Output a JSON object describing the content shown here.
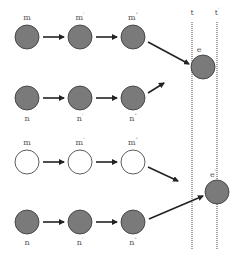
{
  "diagram": {
    "type": "state-transition",
    "colors": {
      "filled": "#7a7a7a",
      "stroke": "#333333",
      "empty": "#ffffff",
      "arrow": "#222222",
      "dotted_line": "#666666",
      "label": "#555555"
    },
    "timelines": [
      {
        "label": "t",
        "prime": "",
        "x": 192
      },
      {
        "label": "t",
        "prime": "′",
        "x": 217
      }
    ],
    "rows": [
      {
        "id": "row1",
        "y": 37,
        "filled": true,
        "label_position": "above",
        "nodes": [
          {
            "label": "m",
            "prime": "",
            "x": 27
          },
          {
            "label": "m",
            "prime": "′",
            "x": 80
          },
          {
            "label": "m",
            "prime": "″",
            "x": 133
          }
        ]
      },
      {
        "id": "row2",
        "y": 98,
        "filled": true,
        "label_position": "below",
        "nodes": [
          {
            "label": "n",
            "prime": "",
            "x": 27
          },
          {
            "label": "n",
            "prime": "′",
            "x": 80
          },
          {
            "label": "n",
            "prime": "″",
            "x": 133
          }
        ]
      },
      {
        "id": "row3",
        "y": 162,
        "filled": false,
        "label_position": "above",
        "nodes": [
          {
            "label": "m",
            "prime": "",
            "x": 27
          },
          {
            "label": "m",
            "prime": "′",
            "x": 80
          },
          {
            "label": "m",
            "prime": "″",
            "x": 133
          }
        ]
      },
      {
        "id": "row4",
        "y": 222,
        "filled": true,
        "label_position": "below",
        "nodes": [
          {
            "label": "n",
            "prime": "",
            "x": 27
          },
          {
            "label": "n",
            "prime": "′",
            "x": 80
          },
          {
            "label": "n",
            "prime": "″",
            "x": 133
          }
        ]
      }
    ],
    "events": [
      {
        "label": "e",
        "prime": "",
        "x": 203,
        "y": 67
      },
      {
        "label": "e",
        "prime": "′",
        "x": 217,
        "y": 192
      }
    ]
  }
}
